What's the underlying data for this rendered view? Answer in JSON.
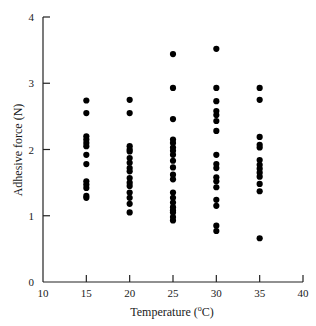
{
  "chart_data": {
    "type": "scatter",
    "title": "",
    "xlabel": "Temperature (°C)",
    "xlabel_parts": {
      "prefix": "Temperature (",
      "superscript": "o",
      "suffix": "C)"
    },
    "ylabel": "Adhesive force (N)",
    "xlim": [
      10,
      40
    ],
    "ylim": [
      0,
      4
    ],
    "xticks": [
      10,
      15,
      20,
      25,
      30,
      35,
      40
    ],
    "yticks": [
      0,
      1,
      2,
      3,
      4
    ],
    "grid": false,
    "legend": null,
    "marker_color": "#000000",
    "series": [
      {
        "name": "Adhesive force",
        "points": [
          {
            "x": 15,
            "ys": [
              2.74,
              2.55,
              2.2,
              2.15,
              2.1,
              2.05,
              1.92,
              1.78,
              1.52,
              1.47,
              1.42,
              1.3,
              1.27
            ]
          },
          {
            "x": 20,
            "ys": [
              2.75,
              2.55,
              2.05,
              2.0,
              1.97,
              1.87,
              1.8,
              1.72,
              1.67,
              1.57,
              1.5,
              1.45,
              1.35,
              1.27,
              1.18,
              1.05
            ]
          },
          {
            "x": 25,
            "ys": [
              3.44,
              2.93,
              2.46,
              2.15,
              2.1,
              2.03,
              1.98,
              1.92,
              1.83,
              1.73,
              1.62,
              1.55,
              1.35,
              1.27,
              1.2,
              1.13,
              1.08,
              1.05,
              0.98,
              0.93
            ]
          },
          {
            "x": 30,
            "ys": [
              3.52,
              2.93,
              2.73,
              2.58,
              2.52,
              2.43,
              2.28,
              1.92,
              1.78,
              1.72,
              1.58,
              1.52,
              1.43,
              1.24,
              1.15,
              0.85,
              0.77
            ]
          },
          {
            "x": 35,
            "ys": [
              2.93,
              2.75,
              2.19,
              2.07,
              2.03,
              1.84,
              1.77,
              1.71,
              1.65,
              1.59,
              1.48,
              1.37,
              0.66
            ]
          }
        ]
      }
    ]
  }
}
